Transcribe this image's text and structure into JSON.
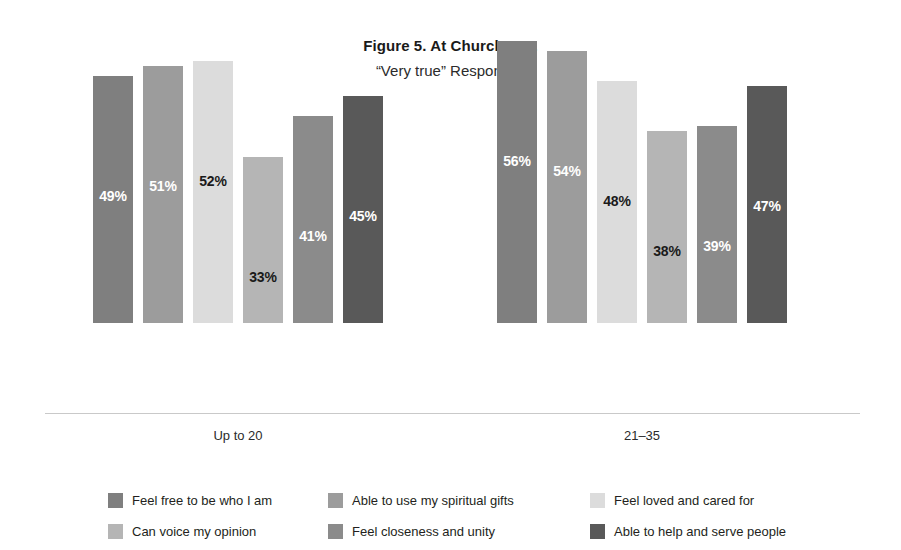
{
  "chart_data": {
    "type": "bar",
    "title": "Figure 5. At Church I . . .",
    "subtitle": "“Very true” Responses",
    "xlabel": "",
    "ylabel": "",
    "ylim": [
      0,
      60
    ],
    "grid": false,
    "legend_position": "bottom",
    "categories": [
      "Up to 20",
      "21–35"
    ],
    "series": [
      {
        "name": "Feel free to be who I am",
        "color": "#7f7f7f",
        "values": [
          49,
          56
        ],
        "labels": [
          "49%",
          "56%"
        ],
        "label_color": "light"
      },
      {
        "name": "Able to use my spiritual gifts",
        "color": "#9c9c9c",
        "values": [
          51,
          54
        ],
        "labels": [
          "51%",
          "54%"
        ],
        "label_color": "light"
      },
      {
        "name": "Feel loved and cared for",
        "color": "#dcdcdc",
        "values": [
          52,
          48
        ],
        "labels": [
          "52%",
          "48%"
        ],
        "label_color": "dark"
      },
      {
        "name": "Can voice my opinion",
        "color": "#b5b5b5",
        "values": [
          33,
          38
        ],
        "labels": [
          "33%",
          "38%"
        ],
        "label_color": "dark"
      },
      {
        "name": "Feel closeness and unity",
        "color": "#8b8b8b",
        "values": [
          41,
          39
        ],
        "labels": [
          "41%",
          "39%"
        ],
        "label_color": "light"
      },
      {
        "name": "Able to help and serve people",
        "color": "#595959",
        "values": [
          45,
          47
        ],
        "labels": [
          "45%",
          "47%"
        ],
        "label_color": "light"
      }
    ]
  },
  "legend": {
    "items": [
      {
        "label": "Feel free to be who I am",
        "color": "#7f7f7f"
      },
      {
        "label": "Able to use my spiritual gifts",
        "color": "#9c9c9c"
      },
      {
        "label": "Feel loved and cared for",
        "color": "#dcdcdc"
      },
      {
        "label": "Can voice my opinion",
        "color": "#b5b5b5"
      },
      {
        "label": "Feel closeness and unity",
        "color": "#8b8b8b"
      },
      {
        "label": "Able to help and serve people",
        "color": "#595959"
      }
    ]
  },
  "axis": {
    "line_color": "#c9c9c9"
  }
}
